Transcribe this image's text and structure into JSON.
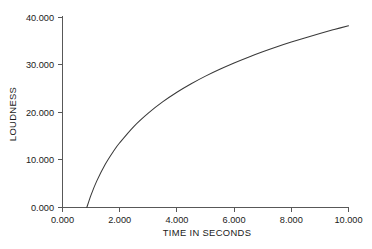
{
  "chart_data": {
    "type": "line",
    "title": "",
    "xlabel": "TIME IN SECONDS",
    "ylabel": "LOUDNESS",
    "xlim": [
      0,
      10
    ],
    "ylim": [
      0,
      40
    ],
    "grid": false,
    "legend": "none",
    "x_tick_labels": [
      "0.000",
      "2.000",
      "4.000",
      "6.000",
      "8.000",
      "10.000"
    ],
    "x_ticks": [
      0,
      2,
      4,
      6,
      8,
      10
    ],
    "y_tick_labels": [
      "0.000",
      "10.000",
      "20.000",
      "30.000",
      "40.000"
    ],
    "y_ticks": [
      0,
      10,
      20,
      30,
      40
    ],
    "series": [
      {
        "name": "loudness",
        "x": [
          0.85,
          1.0,
          1.2,
          1.5,
          1.8,
          2.0,
          2.5,
          3.0,
          3.5,
          4.0,
          4.5,
          5.0,
          5.5,
          6.0,
          6.5,
          7.0,
          7.5,
          8.0,
          8.5,
          9.0,
          9.5,
          10.0
        ],
        "values": [
          0.0,
          2.66,
          5.6,
          9.15,
          12.0,
          13.63,
          17.1,
          19.88,
          22.23,
          24.26,
          26.05,
          27.66,
          29.1,
          30.43,
          31.65,
          32.78,
          33.84,
          34.83,
          35.76,
          36.64,
          37.47,
          38.26
        ]
      }
    ]
  },
  "figure": {
    "x_axis_label": "TIME IN SECONDS",
    "y_axis_label": "LOUDNESS"
  },
  "colors": {
    "curve": "#3a3a3a",
    "axis": "#585858",
    "text": "#1a1a1a",
    "background": "#ffffff"
  }
}
